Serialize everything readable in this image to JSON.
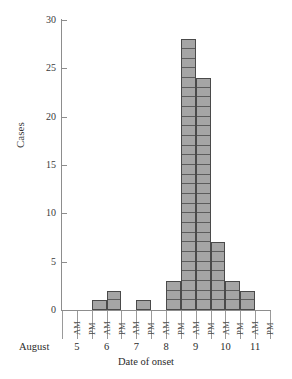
{
  "chart_data": {
    "type": "bar",
    "title": "",
    "xlabel": "Date of onset",
    "ylabel": "Cases",
    "month_label": "August",
    "ylim": [
      0,
      30
    ],
    "ytick_values": [
      0,
      5,
      10,
      15,
      20,
      25,
      30
    ],
    "ytick_labels": [
      "0",
      "5",
      "10",
      "15",
      "20",
      "25",
      "30"
    ],
    "grid": false,
    "legend": "none",
    "bin_sublabels": [
      "AM",
      "PM"
    ],
    "day_labels": [
      "5",
      "6",
      "7",
      "8",
      "9",
      "10",
      "11"
    ],
    "categories": [
      "Aug 5 AM",
      "Aug 5 PM",
      "Aug 6 AM",
      "Aug 6 PM",
      "Aug 7 AM",
      "Aug 7 PM",
      "Aug 8 AM",
      "Aug 8 PM",
      "Aug 9 AM",
      "Aug 9 PM",
      "Aug 10 AM",
      "Aug 10 PM",
      "Aug 11 AM",
      "Aug 11 PM"
    ],
    "values": [
      0,
      0,
      1,
      2,
      0,
      1,
      0,
      3,
      28,
      24,
      7,
      3,
      2,
      0
    ],
    "bar_fill_color": "#a5a5a5",
    "bar_edge_color": "#4a4a4a",
    "axis_color": "#8d8d8d",
    "total_cases": 71
  }
}
